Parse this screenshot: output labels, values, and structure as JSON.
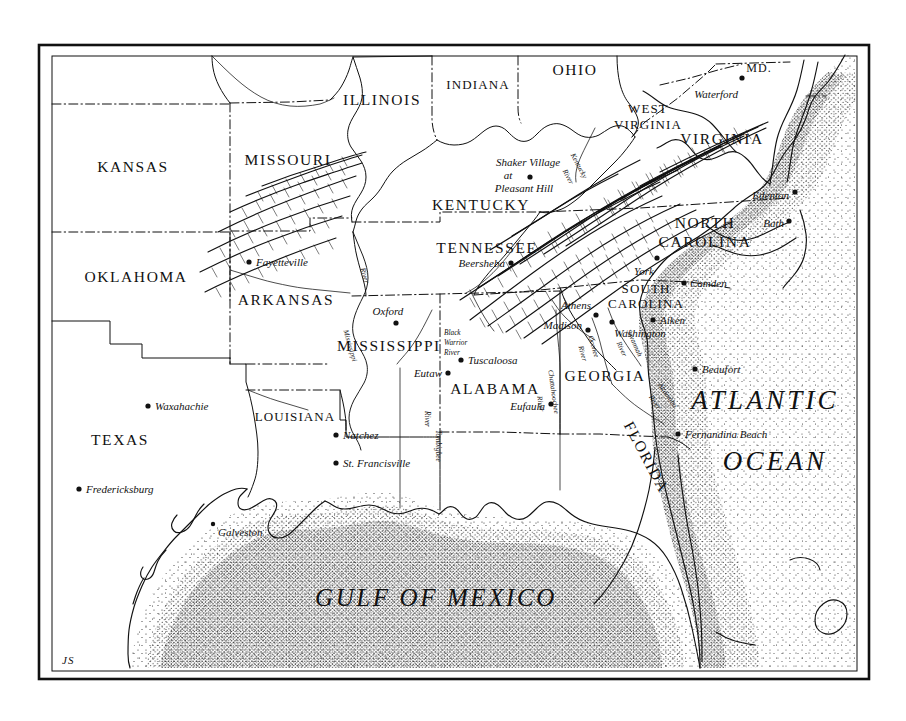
{
  "map": {
    "title": "Southeastern United States",
    "signature": "JS",
    "frame": {
      "style": "double-rule"
    },
    "background_color": "#ffffff",
    "ink_color": "#111111"
  },
  "water_bodies": [
    {
      "id": "atlantic",
      "label_line1": "ATLANTIC",
      "label_line2": "OCEAN"
    },
    {
      "id": "gulf",
      "label": "GULF OF MEXICO"
    }
  ],
  "states": [
    {
      "id": "kansas",
      "label": "KANSAS"
    },
    {
      "id": "missouri",
      "label": "MISSOURI"
    },
    {
      "id": "illinois",
      "label": "ILLINOIS"
    },
    {
      "id": "indiana",
      "label": "INDIANA"
    },
    {
      "id": "ohio",
      "label": "OHIO"
    },
    {
      "id": "west-virginia-1",
      "label": "WEST"
    },
    {
      "id": "west-virginia-2",
      "label": "VIRGINIA"
    },
    {
      "id": "virginia",
      "label": "VIRGINIA"
    },
    {
      "id": "maryland",
      "label": "MD."
    },
    {
      "id": "kentucky",
      "label": "KENTUCKY"
    },
    {
      "id": "tennessee",
      "label": "TENNESSEE"
    },
    {
      "id": "north-carolina-1",
      "label": "NORTH"
    },
    {
      "id": "north-carolina-2",
      "label": "CAROLINA"
    },
    {
      "id": "south-carolina-1",
      "label": "SOUTH"
    },
    {
      "id": "south-carolina-2",
      "label": "CAROLINA"
    },
    {
      "id": "georgia",
      "label": "GEORGIA"
    },
    {
      "id": "florida",
      "label": "FLORIDA"
    },
    {
      "id": "alabama",
      "label": "ALABAMA"
    },
    {
      "id": "mississippi",
      "label": "MISSISSIPPI"
    },
    {
      "id": "louisiana",
      "label": "LOUISIANA"
    },
    {
      "id": "arkansas",
      "label": "ARKANSAS"
    },
    {
      "id": "oklahoma",
      "label": "OKLAHOMA"
    },
    {
      "id": "texas",
      "label": "TEXAS"
    }
  ],
  "cities": [
    {
      "id": "waterford",
      "label": "Waterford"
    },
    {
      "id": "edenton",
      "label": "Edenton"
    },
    {
      "id": "bath",
      "label": "Bath"
    },
    {
      "id": "york",
      "label": "York"
    },
    {
      "id": "camden",
      "label": "Camden"
    },
    {
      "id": "aiken",
      "label": "Aiken"
    },
    {
      "id": "washington",
      "label": "Washington"
    },
    {
      "id": "athens",
      "label": "Athens"
    },
    {
      "id": "madison",
      "label": "Madison"
    },
    {
      "id": "beaufort",
      "label": "Beaufort"
    },
    {
      "id": "fernandina-beach",
      "label": "Fernandina Beach"
    },
    {
      "id": "eufaula",
      "label": "Eufaula"
    },
    {
      "id": "tuscaloosa",
      "label": "Tuscaloosa"
    },
    {
      "id": "eutaw",
      "label": "Eutaw"
    },
    {
      "id": "oxford",
      "label": "Oxford"
    },
    {
      "id": "natchez",
      "label": "Natchez"
    },
    {
      "id": "st-francisville",
      "label": "St. Francisville"
    },
    {
      "id": "galveston",
      "label": "Galveston"
    },
    {
      "id": "fredericksburg",
      "label": "Fredericksburg"
    },
    {
      "id": "waxahachie",
      "label": "Waxahachie"
    },
    {
      "id": "fayetteville",
      "label": "Fayetteville"
    },
    {
      "id": "beersheba",
      "label": "Beersheba"
    }
  ],
  "sites": [
    {
      "id": "shaker-village",
      "line1": "Shaker Village",
      "line2": "at",
      "line3": "Pleasant Hill"
    }
  ],
  "rivers": [
    {
      "id": "kentucky-river",
      "line1": "Kentucky",
      "line2": "River"
    },
    {
      "id": "mississippi-river",
      "line1": "Mississippi",
      "line2": "River"
    },
    {
      "id": "black-warrior",
      "line1": "Black",
      "line2": "Warrior",
      "line3": "River"
    },
    {
      "id": "tombigbee-river",
      "line1": "Tombigbee",
      "line2": "River"
    },
    {
      "id": "chattahoochee",
      "line1": "Chattahoochee",
      "line2": "River"
    },
    {
      "id": "oconee-river",
      "line1": "Oconee",
      "line2": "River"
    },
    {
      "id": "savannah-river",
      "line1": "Savannah",
      "line2": "River"
    },
    {
      "id": "altamaha-river",
      "line1": "Altamaha",
      "line2": "River"
    }
  ]
}
